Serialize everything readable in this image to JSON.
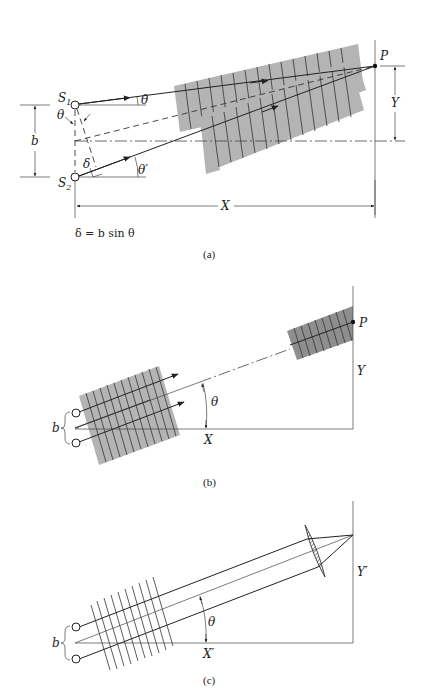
{
  "figure": {
    "panels": [
      {
        "id": "a",
        "caption": "(a)",
        "labels": {
          "s1": "S",
          "s1_sub": "1",
          "s2": "S",
          "s2_sub": "2",
          "point": "P",
          "theta_top": "θ",
          "theta_left": "θ",
          "theta_prime": "θ′",
          "delta": "δ",
          "b": "b",
          "x": "X",
          "y": "Y",
          "formula": "δ = b sin θ"
        }
      },
      {
        "id": "b",
        "caption": "(b)",
        "labels": {
          "point": "P",
          "theta": "θ",
          "b": "b",
          "x": "X",
          "y": "Y"
        }
      },
      {
        "id": "c",
        "caption": "(c)",
        "labels": {
          "theta": "θ",
          "b": "b",
          "x": "X′",
          "y": "Y′"
        }
      }
    ],
    "colors": {
      "line": "#222222",
      "wavefront_band": "#b4b4b4",
      "wavefront_band_dark": "#8e8e8e",
      "background": "#ffffff"
    }
  }
}
